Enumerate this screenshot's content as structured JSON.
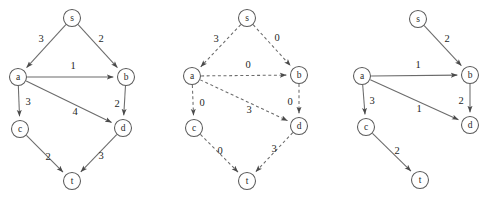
{
  "figure": {
    "width": 491,
    "height": 203,
    "background": "#ffffff",
    "stroke_color": "#6b6b6b",
    "node_stroke": "#5a5a5a",
    "node_radius": 8.5,
    "arrow_color": "#4a4a4a"
  },
  "panels": [
    {
      "id": "panel-original-graph",
      "name": "original-capacity-graph",
      "style": "solid",
      "nodes": [
        {
          "id": "s",
          "label": "s",
          "x": 72,
          "y": 18
        },
        {
          "id": "a",
          "label": "a",
          "x": 18,
          "y": 77
        },
        {
          "id": "b",
          "label": "b",
          "x": 126,
          "y": 77
        },
        {
          "id": "c",
          "label": "c",
          "x": 20,
          "y": 129
        },
        {
          "id": "d",
          "label": "d",
          "x": 123,
          "y": 128
        },
        {
          "id": "t",
          "label": "t",
          "x": 72,
          "y": 181
        }
      ],
      "edges": [
        {
          "from": "s",
          "to": "a",
          "weight": "3",
          "lx": 41,
          "ly": 38
        },
        {
          "from": "s",
          "to": "b",
          "weight": "2",
          "lx": 101,
          "ly": 38
        },
        {
          "from": "a",
          "to": "b",
          "weight": "1",
          "lx": 73,
          "ly": 65
        },
        {
          "from": "a",
          "to": "c",
          "weight": "3",
          "lx": 28,
          "ly": 101
        },
        {
          "from": "a",
          "to": "d",
          "weight": "4",
          "lx": 75,
          "ly": 111
        },
        {
          "from": "b",
          "to": "d",
          "weight": "2",
          "lx": 117,
          "ly": 103
        },
        {
          "from": "c",
          "to": "t",
          "weight": "2",
          "lx": 48,
          "ly": 156
        },
        {
          "from": "d",
          "to": "t",
          "weight": "3",
          "lx": 101,
          "ly": 155
        }
      ]
    },
    {
      "id": "panel-residual-graph",
      "name": "residual-capacity-graph",
      "style": "dashed",
      "nodes": [
        {
          "id": "s",
          "label": "s",
          "x": 247,
          "y": 18
        },
        {
          "id": "a",
          "label": "a",
          "x": 192,
          "y": 76
        },
        {
          "id": "b",
          "label": "b",
          "x": 299,
          "y": 75
        },
        {
          "id": "c",
          "label": "c",
          "x": 194,
          "y": 128
        },
        {
          "id": "d",
          "label": "d",
          "x": 299,
          "y": 126
        },
        {
          "id": "t",
          "label": "t",
          "x": 247,
          "y": 181
        }
      ],
      "edges": [
        {
          "from": "s",
          "to": "a",
          "weight": "3",
          "lx": 216,
          "ly": 38
        },
        {
          "from": "s",
          "to": "b",
          "weight": "0",
          "lx": 277,
          "ly": 37
        },
        {
          "from": "a",
          "to": "b",
          "weight": "0",
          "lx": 248,
          "ly": 64
        },
        {
          "from": "a",
          "to": "c",
          "weight": "0",
          "lx": 202,
          "ly": 102
        },
        {
          "from": "a",
          "to": "d",
          "weight": "3",
          "lx": 249,
          "ly": 109
        },
        {
          "from": "b",
          "to": "d",
          "weight": "0",
          "lx": 290,
          "ly": 101
        },
        {
          "from": "c",
          "to": "t",
          "weight": "0",
          "lx": 220,
          "ly": 150
        },
        {
          "from": "d",
          "to": "t",
          "weight": "3",
          "lx": 274,
          "ly": 148
        }
      ]
    },
    {
      "id": "panel-flow-graph",
      "name": "flow-assignment-graph",
      "style": "solid",
      "nodes": [
        {
          "id": "s",
          "label": "s",
          "x": 418,
          "y": 19
        },
        {
          "id": "a",
          "label": "a",
          "x": 362,
          "y": 76
        },
        {
          "id": "b",
          "label": "b",
          "x": 470,
          "y": 75
        },
        {
          "id": "c",
          "label": "c",
          "x": 366,
          "y": 127
        },
        {
          "id": "d",
          "label": "d",
          "x": 470,
          "y": 125
        },
        {
          "id": "t",
          "label": "t",
          "x": 420,
          "y": 180
        }
      ],
      "edges": [
        {
          "from": "s",
          "to": "b",
          "weight": "2",
          "lx": 447,
          "ly": 38
        },
        {
          "from": "a",
          "to": "b",
          "weight": "1",
          "lx": 418,
          "ly": 64
        },
        {
          "from": "a",
          "to": "c",
          "weight": "3",
          "lx": 372,
          "ly": 100
        },
        {
          "from": "a",
          "to": "d",
          "weight": "1",
          "lx": 419,
          "ly": 108
        },
        {
          "from": "b",
          "to": "d",
          "weight": "2",
          "lx": 461,
          "ly": 100
        },
        {
          "from": "c",
          "to": "t",
          "weight": "2",
          "lx": 397,
          "ly": 150
        }
      ]
    }
  ]
}
